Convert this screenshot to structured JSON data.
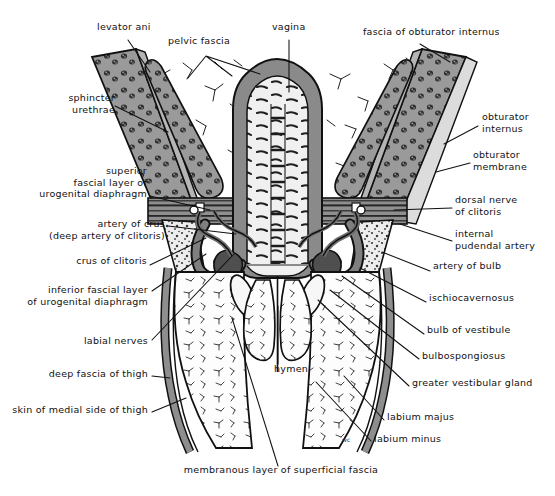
{
  "figure": {
    "width": 555,
    "height": 496,
    "background": "#ffffff",
    "ink": "#111111"
  },
  "palette": {
    "muscle_fill": "#8d8d8d",
    "muscle_dark": "#4a4a4a",
    "fascia_grey": "#9a9a9a",
    "fat_light": "#f2f2f2",
    "vessel_grey": "#7c7c7c",
    "outline": "#1a1a1a",
    "bone_speckle": "#cfcfcf",
    "erectile_dark": "#575757"
  },
  "labels": [
    {
      "id": "levator-ani",
      "text": "levator ani",
      "x": 97,
      "y": 28,
      "align": "left"
    },
    {
      "id": "pelvic-fascia",
      "text": "pelvic fascia",
      "x": 168,
      "y": 42,
      "align": "left"
    },
    {
      "id": "vagina",
      "text": "vagina",
      "x": 272,
      "y": 28,
      "align": "left"
    },
    {
      "id": "fascia-obturator-int",
      "text": "fascia of obturator internus",
      "x": 363,
      "y": 33,
      "align": "left"
    },
    {
      "id": "sphincter-urethrae",
      "text": "sphincter\nurethrae",
      "x": 37,
      "y": 99,
      "align": "left"
    },
    {
      "id": "obturator-internus",
      "text": "obturator\ninternus",
      "x": 482,
      "y": 118,
      "align": "left"
    },
    {
      "id": "obturator-membrane",
      "text": "obturator\nmembrane",
      "x": 473,
      "y": 156,
      "align": "left"
    },
    {
      "id": "superior-fascial-layer",
      "text": "superior\nfascial layer of\nurogenital diaphragm",
      "x": 147,
      "y": 172,
      "align": "right"
    },
    {
      "id": "dorsal-nerve-clitoris",
      "text": "dorsal nerve\nof clitoris",
      "x": 455,
      "y": 201,
      "align": "left"
    },
    {
      "id": "artery-of-crus",
      "text": "artery of crus\n(deep artery of clitoris)",
      "x": 165,
      "y": 225,
      "align": "right"
    },
    {
      "id": "internal-pudendal",
      "text": "internal\npudendal artery",
      "x": 455,
      "y": 235,
      "align": "left"
    },
    {
      "id": "crus-of-clitoris",
      "text": "crus of clitoris",
      "x": 147,
      "y": 262,
      "align": "right"
    },
    {
      "id": "artery-of-bulb",
      "text": "artery of bulb",
      "x": 433,
      "y": 267,
      "align": "left"
    },
    {
      "id": "inferior-fascial-layer",
      "text": "inferior fascial layer\nof urogenital diaphragm",
      "x": 148,
      "y": 291,
      "align": "right"
    },
    {
      "id": "ischiocavernosus",
      "text": "ischiocavernosus",
      "x": 429,
      "y": 299,
      "align": "left"
    },
    {
      "id": "bulb-of-vestibule",
      "text": "bulb of vestibule",
      "x": 427,
      "y": 331,
      "align": "left"
    },
    {
      "id": "labial-nerves",
      "text": "labial nerves",
      "x": 148,
      "y": 342,
      "align": "right"
    },
    {
      "id": "bulbospongiosus",
      "text": "bulbospongiosus",
      "x": 422,
      "y": 357,
      "align": "left"
    },
    {
      "id": "hymen",
      "text": "hymen",
      "x": 274,
      "y": 370,
      "align": "left"
    },
    {
      "id": "deep-fascia-thigh",
      "text": "deep fascia of thigh",
      "x": 148,
      "y": 375,
      "align": "right"
    },
    {
      "id": "greater-vestibular",
      "text": "greater vestibular gland",
      "x": 412,
      "y": 384,
      "align": "left"
    },
    {
      "id": "skin-medial-thigh",
      "text": "skin of medial side of thigh",
      "x": 148,
      "y": 411,
      "align": "right"
    },
    {
      "id": "labium-majus",
      "text": "labium majus",
      "x": 387,
      "y": 418,
      "align": "left"
    },
    {
      "id": "labium-minus",
      "text": "labium minus",
      "x": 374,
      "y": 440,
      "align": "left"
    },
    {
      "id": "tiny-mark",
      "text": "wc",
      "x": 342,
      "y": 437,
      "align": "left",
      "tiny": true
    },
    {
      "id": "membranous-layer",
      "text": "membranous layer of superficial fascia",
      "x": 281,
      "y": 471,
      "align": "center"
    }
  ]
}
